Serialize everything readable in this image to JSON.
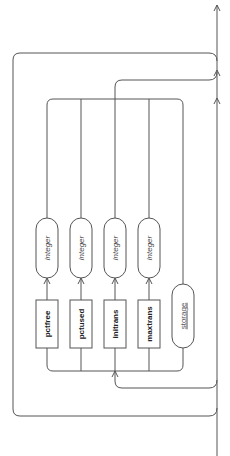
{
  "diagram": {
    "type": "railroad-syntax-diagram",
    "orientation": "rotated-90-ccw",
    "choices": [
      {
        "keyword": "pctfree",
        "value": "integer"
      },
      {
        "keyword": "pctused",
        "value": "integer"
      },
      {
        "keyword": "initrans",
        "value": "integer"
      },
      {
        "keyword": "maxtrans",
        "value": "integer"
      },
      {
        "keyword": "storage",
        "value": null,
        "is_reference": true
      }
    ],
    "colors": {
      "line": "#555555",
      "text": "#222222",
      "background": "#ffffff"
    }
  }
}
